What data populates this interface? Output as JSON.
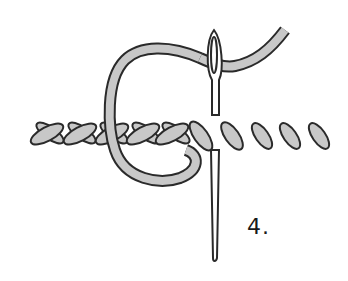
{
  "illustration": {
    "subject": "cross stitch / herringbone sewing step with needle and thread",
    "step_label": "4.",
    "colors": {
      "thread_fill": "#c8c8c8",
      "outline": "#2a2a2a",
      "background": "#ffffff"
    }
  }
}
